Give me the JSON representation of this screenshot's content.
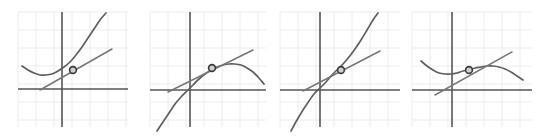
{
  "figure": {
    "title": "",
    "panel_count": 4,
    "width": 544,
    "height": 138,
    "background": "#ffffff"
  },
  "style": {
    "grid_color": "#f0eaea",
    "grid_spacing": 18,
    "axis_color": "#555555",
    "axis_width": 1.6,
    "curve_color": "#5f5f5f",
    "curve_width": 1.7,
    "tangent_color": "#777777",
    "tangent_width": 1.5,
    "marker_fill": "#cfcfcf",
    "marker_stroke": "#3a3a3a",
    "marker_radius": 3.4
  },
  "chart_data": {
    "type": "line",
    "xlabel": "",
    "ylabel": "",
    "grid": true,
    "legend": null,
    "panels": [
      {
        "name": "panel-1",
        "label": "",
        "description": "Upward-opening curve (local minimum at left), increasing through the marked point; tangent line has positive slope and lies below the curve.",
        "grid_box": {
          "x0": 18,
          "y0": 12,
          "x1": 128,
          "y1": 127
        },
        "axes": {
          "x_axis_y": 89,
          "y_axis_x": 62
        },
        "series": [
          {
            "name": "curve",
            "kind": "curve",
            "points": [
              [
                22,
                66
              ],
              [
                28,
                70
              ],
              [
                34,
                73
              ],
              [
                40,
                75
              ],
              [
                46,
                75
              ],
              [
                52,
                74
              ],
              [
                58,
                71
              ],
              [
                64,
                67
              ],
              [
                70,
                62
              ],
              [
                76,
                55
              ],
              [
                82,
                47
              ],
              [
                88,
                38
              ],
              [
                94,
                29
              ],
              [
                100,
                20
              ],
              [
                106,
                13
              ]
            ]
          },
          {
            "name": "tangent-line",
            "kind": "line",
            "points": [
              [
                40,
                90
              ],
              [
                112,
                49
              ]
            ]
          }
        ],
        "marker": {
          "x": 73,
          "y": 70
        }
      },
      {
        "name": "panel-2",
        "label": "",
        "description": "S-shaped curve rising from lower left, bending over to a local maximum at the right; tangent line has positive slope and lies above the curve at the marked point.",
        "grid_box": {
          "x0": 150,
          "y0": 12,
          "x1": 266,
          "y1": 127
        },
        "axes": {
          "x_axis_y": 90,
          "y_axis_x": 190
        },
        "series": [
          {
            "name": "curve",
            "kind": "curve",
            "points": [
              [
                157,
                131
              ],
              [
                163,
                122
              ],
              [
                169,
                113
              ],
              [
                175,
                104
              ],
              [
                181,
                97
              ],
              [
                187,
                91
              ],
              [
                193,
                85
              ],
              [
                199,
                79
              ],
              [
                205,
                74
              ],
              [
                211,
                70
              ],
              [
                217,
                67
              ],
              [
                223,
                65
              ],
              [
                229,
                64
              ],
              [
                235,
                64
              ],
              [
                241,
                65
              ],
              [
                247,
                68
              ],
              [
                253,
                72
              ],
              [
                259,
                78
              ],
              [
                264,
                84
              ]
            ]
          },
          {
            "name": "tangent-line",
            "kind": "line",
            "points": [
              [
                168,
                92
              ],
              [
                253,
                50
              ]
            ]
          }
        ],
        "marker": {
          "x": 212,
          "y": 68
        }
      },
      {
        "name": "panel-3",
        "label": "",
        "description": "Steadily increasing S-shaped curve through the origin region; tangent line has positive slope and touches the curve at the marked point near the inflection.",
        "grid_box": {
          "x0": 280,
          "y0": 12,
          "x1": 400,
          "y1": 127
        },
        "axes": {
          "x_axis_y": 90,
          "y_axis_x": 320
        },
        "series": [
          {
            "name": "curve",
            "kind": "curve",
            "points": [
              [
                291,
                131
              ],
              [
                297,
                120
              ],
              [
                303,
                110
              ],
              [
                309,
                101
              ],
              [
                314,
                94
              ],
              [
                320,
                88
              ],
              [
                326,
                82
              ],
              [
                331,
                76
              ],
              [
                337,
                70
              ],
              [
                343,
                64
              ],
              [
                349,
                57
              ],
              [
                355,
                49
              ],
              [
                361,
                40
              ],
              [
                367,
                30
              ],
              [
                373,
                20
              ],
              [
                378,
                13
              ]
            ]
          },
          {
            "name": "tangent-line",
            "kind": "line",
            "points": [
              [
                303,
                91
              ],
              [
                380,
                51
              ]
            ]
          }
        ],
        "marker": {
          "x": 341,
          "y": 70
        }
      },
      {
        "name": "panel-4",
        "label": "",
        "description": "Curve with a local minimum at the left, rising through the marked point to a local maximum on the right then falling; tangent line has positive slope.",
        "grid_box": {
          "x0": 412,
          "y0": 12,
          "x1": 532,
          "y1": 127
        },
        "axes": {
          "x_axis_y": 90,
          "y_axis_x": 452
        },
        "series": [
          {
            "name": "curve",
            "kind": "curve",
            "points": [
              [
                421,
                61
              ],
              [
                427,
                66
              ],
              [
                433,
                70
              ],
              [
                439,
                73
              ],
              [
                445,
                74
              ],
              [
                451,
                74
              ],
              [
                457,
                73
              ],
              [
                463,
                71
              ],
              [
                469,
                70
              ],
              [
                475,
                68
              ],
              [
                481,
                67
              ],
              [
                487,
                66
              ],
              [
                493,
                66
              ],
              [
                499,
                67
              ],
              [
                505,
                69
              ],
              [
                511,
                72
              ],
              [
                517,
                76
              ],
              [
                523,
                80
              ]
            ]
          },
          {
            "name": "tangent-line",
            "kind": "line",
            "points": [
              [
                435,
                95
              ],
              [
                512,
                52
              ]
            ]
          }
        ],
        "marker": {
          "x": 469,
          "y": 70
        }
      }
    ]
  }
}
